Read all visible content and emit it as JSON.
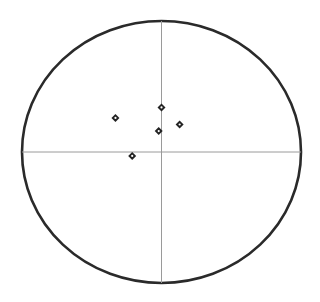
{
  "chart_data": {
    "type": "scatter",
    "title": "",
    "xlabel": "",
    "ylabel": "",
    "xlim": [
      -1,
      1
    ],
    "ylim": [
      -1,
      1
    ],
    "grid": false,
    "legend": null,
    "series": [
      {
        "name": "points",
        "points": [
          {
            "x": -0.33,
            "y": 0.26
          },
          {
            "x": 0.0,
            "y": 0.34
          },
          {
            "x": 0.13,
            "y": 0.21
          },
          {
            "x": -0.02,
            "y": 0.16
          },
          {
            "x": -0.21,
            "y": -0.03
          }
        ]
      }
    ]
  },
  "style": {
    "circle_color": "#2a2a2a",
    "axis_color": "#9a9a9a",
    "marker_color": "#222222"
  }
}
